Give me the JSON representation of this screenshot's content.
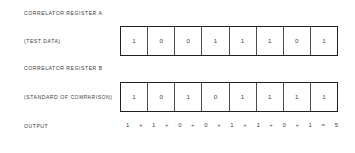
{
  "diagram": {
    "register_a": {
      "heading": "CORRELATOR REGISTER A",
      "sublabel": "(TEST DATA)",
      "bits": [
        "1",
        "0",
        "0",
        "1",
        "1",
        "1",
        "0",
        "1"
      ]
    },
    "register_b": {
      "heading": "CORRELATOR REGISTER B",
      "sublabel": "(STANDARD OF COMPARISON)",
      "bits": [
        "1",
        "0",
        "1",
        "0",
        "1",
        "1",
        "1",
        "1"
      ]
    },
    "output": {
      "label": "OUTPUT",
      "terms": [
        "1",
        "1",
        "0",
        "0",
        "1",
        "1",
        "0",
        "1"
      ],
      "operator": "+",
      "equals": "=",
      "result": "5"
    },
    "colors": {
      "background": "#ffffff",
      "ink": "#2a2a2a",
      "box_border": "#1f1f1f",
      "cell_divider": "#4a4a4a"
    }
  }
}
